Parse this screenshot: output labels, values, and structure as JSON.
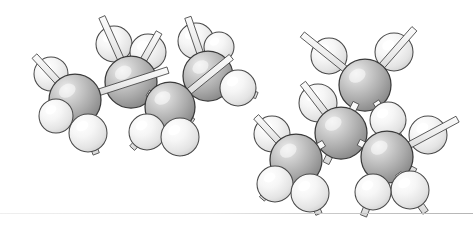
{
  "figure": {
    "background_color": "#ffffff",
    "width": 473,
    "height": 226,
    "caption": ""
  },
  "style": {
    "carbon_fill_light": "#e8e8e8",
    "carbon_fill_mid": "#b9b9b9",
    "carbon_fill_dark": "#8e8e8e",
    "carbon_outline": "#3a3a3a",
    "hydrogen_fill_light": "#ffffff",
    "hydrogen_fill_mid": "#f2f2f2",
    "hydrogen_fill_dark": "#d2d2d2",
    "hydrogen_outline": "#4a4a4a",
    "bond_fill": "#f0f0f0",
    "bond_outline": "#4a4a4a",
    "scan_line_color": "#c9c9c9"
  },
  "legend": {
    "carbon_label": "carbon",
    "hydrogen_label": "hydrogen",
    "bond_label": "covalent bond"
  },
  "molecules": [
    {
      "name": "butane-anti-conformer",
      "label": "Butane (anti / extended conformation)",
      "formula": "C4H10",
      "atom_counts": {
        "carbon": 4,
        "hydrogen": 10
      },
      "atoms": [
        {
          "id": "L-C1",
          "element": "C",
          "x": 75,
          "y": 100,
          "r": 26
        },
        {
          "id": "L-C2",
          "element": "C",
          "x": 131,
          "y": 82,
          "r": 26
        },
        {
          "id": "L-C3",
          "element": "C",
          "x": 170,
          "y": 107,
          "r": 25
        },
        {
          "id": "L-C4",
          "element": "C",
          "x": 208,
          "y": 76,
          "r": 25
        },
        {
          "id": "L-H1",
          "element": "H",
          "x": 51,
          "y": 74,
          "r": 17
        },
        {
          "id": "L-H2",
          "element": "H",
          "x": 56,
          "y": 116,
          "r": 17
        },
        {
          "id": "L-H3",
          "element": "H",
          "x": 88,
          "y": 133,
          "r": 19
        },
        {
          "id": "L-H4",
          "element": "H",
          "x": 114,
          "y": 44,
          "r": 18
        },
        {
          "id": "L-H5",
          "element": "H",
          "x": 148,
          "y": 52,
          "r": 18
        },
        {
          "id": "L-H6",
          "element": "H",
          "x": 147,
          "y": 132,
          "r": 18
        },
        {
          "id": "L-H7",
          "element": "H",
          "x": 180,
          "y": 137,
          "r": 19
        },
        {
          "id": "L-H8",
          "element": "H",
          "x": 196,
          "y": 41,
          "r": 18
        },
        {
          "id": "L-H9",
          "element": "H",
          "x": 238,
          "y": 88,
          "r": 18
        },
        {
          "id": "L-H10",
          "element": "H",
          "x": 219,
          "y": 47,
          "r": 15
        }
      ],
      "bonds": [
        {
          "from": "L-C1",
          "to": "L-C2",
          "order": 1
        },
        {
          "from": "L-C2",
          "to": "L-C3",
          "order": 1
        },
        {
          "from": "L-C3",
          "to": "L-C4",
          "order": 1
        },
        {
          "from": "L-C1",
          "to": "L-H1",
          "order": 1
        },
        {
          "from": "L-C1",
          "to": "L-H2",
          "order": 1
        },
        {
          "from": "L-C1",
          "to": "L-H3",
          "order": 1
        },
        {
          "from": "L-C2",
          "to": "L-H4",
          "order": 1
        },
        {
          "from": "L-C2",
          "to": "L-H5",
          "order": 1
        },
        {
          "from": "L-C3",
          "to": "L-H6",
          "order": 1
        },
        {
          "from": "L-C3",
          "to": "L-H7",
          "order": 1
        },
        {
          "from": "L-C4",
          "to": "L-H8",
          "order": 1
        },
        {
          "from": "L-C4",
          "to": "L-H9",
          "order": 1
        }
      ]
    },
    {
      "name": "butane-gauche-conformer",
      "label": "Butane (gauche / folded conformation)",
      "formula": "C4H10",
      "atom_counts": {
        "carbon": 4,
        "hydrogen": 10
      },
      "atoms": [
        {
          "id": "R-C1",
          "element": "C",
          "x": 365,
          "y": 85,
          "r": 26
        },
        {
          "id": "R-C2",
          "element": "C",
          "x": 341,
          "y": 133,
          "r": 26
        },
        {
          "id": "R-C3",
          "element": "C",
          "x": 296,
          "y": 160,
          "r": 26
        },
        {
          "id": "R-C4",
          "element": "C",
          "x": 387,
          "y": 157,
          "r": 26
        },
        {
          "id": "R-H1",
          "element": "H",
          "x": 329,
          "y": 56,
          "r": 18
        },
        {
          "id": "R-H2",
          "element": "H",
          "x": 394,
          "y": 52,
          "r": 19
        },
        {
          "id": "R-H3",
          "element": "H",
          "x": 388,
          "y": 120,
          "r": 18
        },
        {
          "id": "R-H4",
          "element": "H",
          "x": 318,
          "y": 103,
          "r": 19
        },
        {
          "id": "R-H5",
          "element": "H",
          "x": 272,
          "y": 134,
          "r": 18
        },
        {
          "id": "R-H6",
          "element": "H",
          "x": 275,
          "y": 184,
          "r": 18
        },
        {
          "id": "R-H7",
          "element": "H",
          "x": 310,
          "y": 193,
          "r": 19
        },
        {
          "id": "R-H8",
          "element": "H",
          "x": 428,
          "y": 135,
          "r": 19
        },
        {
          "id": "R-H9",
          "element": "H",
          "x": 373,
          "y": 192,
          "r": 18
        },
        {
          "id": "R-H10",
          "element": "H",
          "x": 410,
          "y": 190,
          "r": 19
        }
      ],
      "bonds": [
        {
          "from": "R-C1",
          "to": "R-C2",
          "order": 1
        },
        {
          "from": "R-C2",
          "to": "R-C3",
          "order": 1
        },
        {
          "from": "R-C2",
          "to": "R-C4",
          "order": 1
        },
        {
          "from": "R-C1",
          "to": "R-H1",
          "order": 1
        },
        {
          "from": "R-C1",
          "to": "R-H2",
          "order": 1
        },
        {
          "from": "R-C1",
          "to": "R-H3",
          "order": 1
        },
        {
          "from": "R-C2",
          "to": "R-H4",
          "order": 1
        },
        {
          "from": "R-C3",
          "to": "R-H5",
          "order": 1
        },
        {
          "from": "R-C3",
          "to": "R-H6",
          "order": 1
        },
        {
          "from": "R-C3",
          "to": "R-H7",
          "order": 1
        },
        {
          "from": "R-C4",
          "to": "R-H8",
          "order": 1
        },
        {
          "from": "R-C4",
          "to": "R-H9",
          "order": 1
        },
        {
          "from": "R-C4",
          "to": "R-H10",
          "order": 1
        }
      ]
    }
  ],
  "artifacts": {
    "scan_line": {
      "y": 213,
      "x_start": 0,
      "x_end": 473,
      "color": "#c9c9c9"
    }
  }
}
